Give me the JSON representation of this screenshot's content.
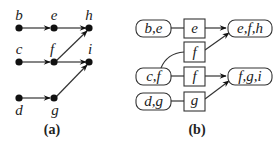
{
  "panel_a": {
    "caption": "(a)",
    "nodes": [
      {
        "id": "b",
        "label": "b"
      },
      {
        "id": "e",
        "label": "e"
      },
      {
        "id": "h",
        "label": "h"
      },
      {
        "id": "c",
        "label": "c"
      },
      {
        "id": "f",
        "label": "f"
      },
      {
        "id": "i",
        "label": "i"
      },
      {
        "id": "d",
        "label": "d"
      },
      {
        "id": "g",
        "label": "g"
      }
    ],
    "edges": [
      [
        "b",
        "e"
      ],
      [
        "e",
        "h"
      ],
      [
        "c",
        "f"
      ],
      [
        "f",
        "h"
      ],
      [
        "f",
        "i"
      ],
      [
        "d",
        "g"
      ],
      [
        "g",
        "i"
      ]
    ]
  },
  "panel_b": {
    "caption": "(b)",
    "clusters": [
      {
        "id": "be",
        "label": "b,e"
      },
      {
        "id": "cf",
        "label": "c,f"
      },
      {
        "id": "dg",
        "label": "d,g"
      },
      {
        "id": "efh",
        "label": "e,f,h"
      },
      {
        "id": "fgi",
        "label": "f,g,i"
      }
    ],
    "separators": [
      {
        "id": "sep-e",
        "label": "e"
      },
      {
        "id": "sep-f-top",
        "label": "f"
      },
      {
        "id": "sep-f-mid",
        "label": "f"
      },
      {
        "id": "sep-g",
        "label": "g"
      }
    ]
  }
}
